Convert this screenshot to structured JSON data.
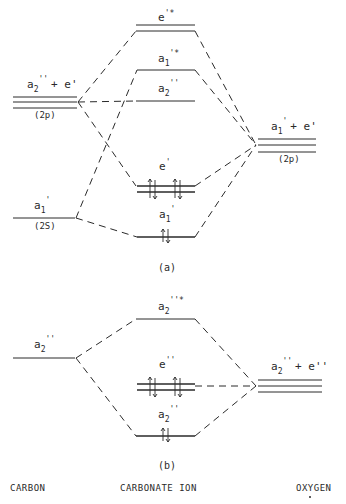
{
  "diagram": {
    "panels": [
      {
        "id": "a",
        "caption": "(a)",
        "carbon_levels": [
          {
            "label_main": "a",
            "label_sub": "2",
            "label_sup": "''",
            "label_extra": " + e'",
            "orbital": "(2p)"
          },
          {
            "label_main": "a",
            "label_sub": "1",
            "label_sup": "'",
            "orbital": "(2S)"
          }
        ],
        "mo_levels": [
          {
            "label_main": "e",
            "label_sup": "'*",
            "occupancy": 0,
            "degenerate": 2
          },
          {
            "label_main": "a",
            "label_sub": "1",
            "label_sup": "'*",
            "occupancy": 0,
            "degenerate": 1
          },
          {
            "label_main": "a",
            "label_sub": "2",
            "label_sup": "''",
            "occupancy": 0,
            "degenerate": 1
          },
          {
            "label_main": "e",
            "label_sup": "'",
            "occupancy": 4,
            "degenerate": 2
          },
          {
            "label_main": "a",
            "label_sub": "1",
            "label_sup": "'",
            "occupancy": 2,
            "degenerate": 1
          }
        ],
        "oxygen_levels": [
          {
            "label_main": "a",
            "label_sub": "1",
            "label_sup": "'",
            "label_extra": " + e'",
            "orbital": "(2p)"
          }
        ]
      },
      {
        "id": "b",
        "caption": "(b)",
        "carbon_levels": [
          {
            "label_main": "a",
            "label_sub": "2",
            "label_sup": "''"
          }
        ],
        "mo_levels": [
          {
            "label_main": "a",
            "label_sub": "2",
            "label_sup": "''*",
            "occupancy": 0,
            "degenerate": 1
          },
          {
            "label_main": "e",
            "label_sup": "''",
            "occupancy": 4,
            "degenerate": 2
          },
          {
            "label_main": "a",
            "label_sub": "2",
            "label_sup": "''",
            "occupancy": 2,
            "degenerate": 1
          }
        ],
        "oxygen_levels": [
          {
            "label_main": "a",
            "label_sub": "2",
            "label_sup": "''",
            "label_extra": " + e''"
          }
        ]
      }
    ],
    "column_labels": {
      "left": "CARBON",
      "center": "CARBONATE ION",
      "right": "OXYGEN"
    },
    "text": {
      "a_e_star": "e",
      "a_e_star_sup": "'*",
      "a_a1_star": "a",
      "a_a1_star_sub": "1",
      "a_a1_star_sup": "'*",
      "a_a2": "a",
      "a_a2_sub": "2",
      "a_a2_sup": "''",
      "a_c2p_main": "a",
      "a_c2p_sub": "2",
      "a_c2p_sup": "''",
      "a_c2p_extra": "+ e'",
      "a_c2p_orb": "(2p)",
      "a_c2s_main": "a",
      "a_c2s_sub": "1",
      "a_c2s_sup": "'",
      "a_c2s_orb": "(2S)",
      "a_e": "e",
      "a_e_sup": "'",
      "a_a1": "a",
      "a_a1_sub": "1",
      "a_a1_sup": "'",
      "a_o2p_main": "a",
      "a_o2p_sub": "1",
      "a_o2p_sup": "'",
      "a_o2p_extra": "+ e'",
      "a_o2p_orb": "(2p)",
      "b_a2_star": "a",
      "b_a2_star_sub": "2",
      "b_a2_star_sup": "''*",
      "b_c_main": "a",
      "b_c_sub": "2",
      "b_c_sup": "''",
      "b_e": "e",
      "b_e_sup": "''",
      "b_a2": "a",
      "b_a2_sub": "2",
      "b_a2_sup": "''",
      "b_o_main": "a",
      "b_o_sub": "2",
      "b_o_sup": "''",
      "b_o_extra": "+ e''",
      "caption_a": "(a)",
      "caption_b": "(b)",
      "col_left": "CARBON",
      "col_center": "CARBONATE ION",
      "col_right": "OXYGEN"
    }
  }
}
